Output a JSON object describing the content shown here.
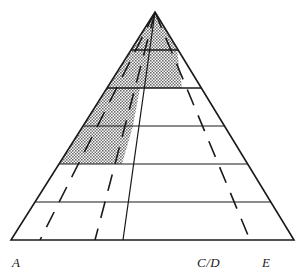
{
  "figure": {
    "name": "pyramid-triangle-diagram",
    "type": "triangular-classification-diagram",
    "background_color": "#ffffff",
    "stroke_color": "#1a1a1a",
    "shade_color": "#8c8c8c"
  },
  "labels": {
    "left": "A",
    "center_right": "C/D",
    "right": "E"
  },
  "chart_data": {
    "type": "diagram",
    "title": "",
    "xlabel": "",
    "ylabel": "",
    "apex": {
      "x": 155,
      "y": 12
    },
    "base": {
      "y": 240,
      "x_left": 11,
      "x_right": 294
    },
    "band_boundaries_y": [
      12,
      50,
      88,
      126,
      164,
      202,
      240
    ],
    "band_count": 6,
    "radial_dashed_lines_base_x": [
      40,
      95,
      250
    ],
    "radial_solid_line_base_x": [
      123
    ],
    "shaded_region": {
      "fill": "halftone-gray",
      "description": "upper-left stepped polygon spanning bands 1 through 4",
      "vertices": [
        {
          "x": 155,
          "y": 12
        },
        {
          "x": 177,
          "y": 50
        },
        {
          "x": 182,
          "y": 88
        },
        {
          "x": 140,
          "y": 88
        },
        {
          "x": 133,
          "y": 126
        },
        {
          "x": 122,
          "y": 164
        },
        {
          "x": 60,
          "y": 164
        },
        {
          "x": 98,
          "y": 88
        },
        {
          "x": 117,
          "y": 50
        }
      ]
    },
    "legend": [],
    "grid": false
  }
}
